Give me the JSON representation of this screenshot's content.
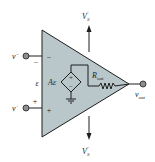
{
  "diagram": {
    "colors": {
      "body_fill": "#b9c7ca",
      "line": "#1e1e1e",
      "terminal": "#8a8f90"
    },
    "labels": {
      "v_minus": "v",
      "v_minus_sup": "−",
      "v_plus": "v",
      "v_plus_sup": "+",
      "minus_sign_outer": "−",
      "minus_sign_inner": "−",
      "plus_sign_outer": "+",
      "plus_sign_inner": "+",
      "epsilon": "ε",
      "gain_A": "A",
      "gain_eps": "ε",
      "src_plus": "+",
      "src_minus": "−",
      "r_out": "R",
      "r_out_sub": "out",
      "v_out": "v",
      "v_out_sub": "out",
      "vs_plus": "V",
      "vs_plus_sub": "S",
      "vs_plus_sup": "+",
      "vs_minus": "V",
      "vs_minus_sub": "S",
      "vs_minus_sup": "−"
    }
  }
}
